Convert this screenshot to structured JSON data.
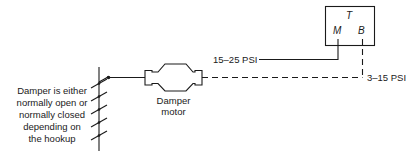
{
  "thermostat": {
    "label": "T",
    "port_main": "M",
    "port_branch": "B"
  },
  "lines": {
    "main_pressure": "15–25 PSI",
    "branch_pressure": "3–15 PSI"
  },
  "motor": {
    "label_line1": "Damper",
    "label_line2": "motor"
  },
  "damper": {
    "note_lines": [
      "Damper is either",
      "normally open or",
      "normally closed",
      "depending on",
      "the hookup"
    ],
    "blade_count": 5
  },
  "colors": {
    "ink": "#1a1a1a",
    "background": "#ffffff"
  }
}
